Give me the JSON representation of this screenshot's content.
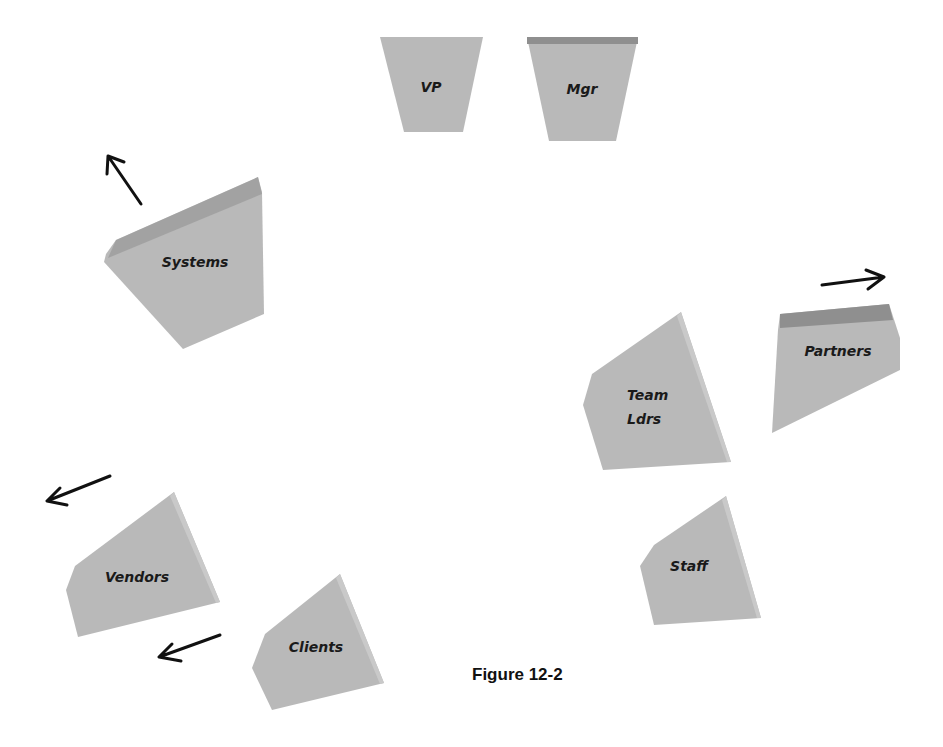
{
  "caption": "Figure 12-2",
  "colors": {
    "block_fill": "#b9b9b9",
    "block_top_edge": "#8f8f8f",
    "arrow": "#111111",
    "background": "#ffffff"
  },
  "blocks": [
    {
      "id": "vp",
      "label": "VP"
    },
    {
      "id": "mgr",
      "label": "Mgr"
    },
    {
      "id": "systems",
      "label": "Systems"
    },
    {
      "id": "team-ldrs",
      "label_line1": "Team",
      "label_line2": "Ldrs"
    },
    {
      "id": "partners",
      "label": "Partners"
    },
    {
      "id": "staff",
      "label": "Staff"
    },
    {
      "id": "vendors",
      "label": "Vendors"
    },
    {
      "id": "clients",
      "label": "Clients"
    }
  ],
  "arrows": [
    {
      "id": "systems-arrow",
      "direction": "up-left"
    },
    {
      "id": "partners-arrow",
      "direction": "right"
    },
    {
      "id": "vendors-arrow",
      "direction": "down-left"
    },
    {
      "id": "clients-arrow",
      "direction": "down-left"
    }
  ]
}
